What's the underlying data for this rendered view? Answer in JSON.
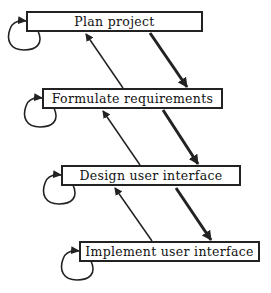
{
  "diagram": {
    "type": "waterfall-process",
    "colors": {
      "stroke": "#222222",
      "background": "#ffffff",
      "text": "#111111"
    },
    "steps": [
      {
        "label": "Plan project",
        "x": 26,
        "y": 11,
        "w": 177,
        "h": 21
      },
      {
        "label": "Formulate requirements",
        "x": 42,
        "y": 88,
        "w": 181,
        "h": 21
      },
      {
        "label": "Design user interface",
        "x": 61,
        "y": 165,
        "w": 180,
        "h": 21
      },
      {
        "label": "Implement user interface",
        "x": 79,
        "y": 241,
        "w": 181,
        "h": 21
      }
    ],
    "forward_arrows": [
      {
        "from": "Plan project",
        "to": "Formulate requirements",
        "x1": 150,
        "y1": 33,
        "x2": 187,
        "y2": 88
      },
      {
        "from": "Formulate requirements",
        "to": "Design user interface",
        "x1": 163,
        "y1": 110,
        "x2": 198,
        "y2": 165
      },
      {
        "from": "Design user interface",
        "to": "Implement user interface",
        "x1": 176,
        "y1": 188,
        "x2": 211,
        "y2": 241
      }
    ],
    "feedback_arrows": [
      {
        "from": "Formulate requirements",
        "to": "Plan project",
        "x1": 123,
        "y1": 88,
        "x2": 85,
        "y2": 33
      },
      {
        "from": "Design user interface",
        "to": "Formulate requirements",
        "x1": 140,
        "y1": 165,
        "x2": 102,
        "y2": 110
      },
      {
        "from": "Implement user interface",
        "to": "Design user interface",
        "x1": 152,
        "y1": 241,
        "x2": 114,
        "y2": 187
      }
    ],
    "self_loops": [
      {
        "step": "Plan project"
      },
      {
        "step": "Formulate requirements"
      },
      {
        "step": "Design user interface"
      },
      {
        "step": "Implement user interface"
      }
    ]
  }
}
